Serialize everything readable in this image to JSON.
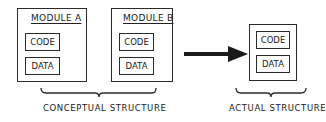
{
  "conceptual": {
    "modules": [
      {
        "title": "MODULE A",
        "segments": [
          "CODE",
          "DATA"
        ]
      },
      {
        "title": "MODULE B",
        "segments": [
          "CODE",
          "DATA"
        ]
      }
    ],
    "caption": "CONCEPTUAL STRUCTURE"
  },
  "actual": {
    "segments": [
      "CODE",
      "DATA"
    ],
    "caption": "ACTUAL STRUCTURE"
  },
  "colors": {
    "line": "#2a2a2a",
    "background": "#ffffff"
  }
}
